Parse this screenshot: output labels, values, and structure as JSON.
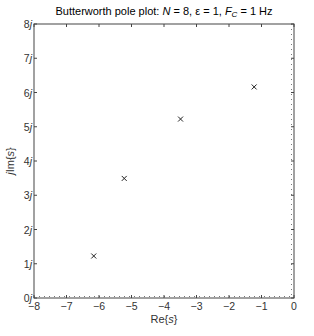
{
  "chart_data": {
    "type": "scatter",
    "title_parts": {
      "prefix": "Butterworth pole plot:  ",
      "n_sym": "N",
      "n_val": " = 8, ",
      "eps": "ε = 1, ",
      "fc_sym": "F",
      "fc_sub": "C",
      "fc_val": " = 1 Hz"
    },
    "xlabel": "Re{s}",
    "ylabel": "jIm{s}",
    "xlim": [
      -8,
      0
    ],
    "ylim": [
      0,
      8
    ],
    "xticks": [
      -8,
      -7,
      -6,
      -5,
      -4,
      -3,
      -2,
      -1,
      0
    ],
    "xtick_labels": [
      "−8",
      "−7",
      "−6",
      "−5",
      "−4",
      "−3",
      "−2",
      "−1",
      "0"
    ],
    "yticks": [
      0,
      1,
      2,
      3,
      4,
      5,
      6,
      7,
      8
    ],
    "ytick_labels": [
      "0j",
      "1j",
      "2j",
      "3j",
      "4j",
      "5j",
      "6j",
      "7j",
      "8j"
    ],
    "grid": false,
    "reference_lines": [
      {
        "axis": "y",
        "value": 0,
        "style": "dotted"
      },
      {
        "axis": "x",
        "value": 0,
        "style": "dotted"
      }
    ],
    "marker": "x",
    "series": [
      {
        "name": "poles",
        "points": [
          {
            "x": -6.162,
            "y": 1.226
          },
          {
            "x": -5.224,
            "y": 3.491
          },
          {
            "x": -3.491,
            "y": 5.224
          },
          {
            "x": -1.226,
            "y": 6.162
          }
        ]
      }
    ],
    "legend": null
  }
}
